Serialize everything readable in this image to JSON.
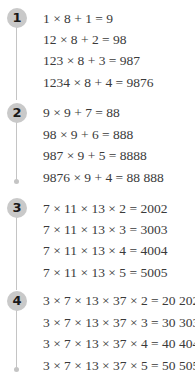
{
  "sections": [
    {
      "number": "1",
      "equations": [
        "1 × 8 + 1 = 9",
        "12 × 8 + 2 = 98",
        "123 × 8 + 3 = 987",
        "1234 × 8 + 4 = 9876"
      ]
    },
    {
      "number": "2",
      "equations": [
        "9 × 9 + 7 = 88",
        "98 × 9 + 6 = 888",
        "987 × 9 + 5 = 8888",
        "9876 × 9 + 4 = 88 888"
      ]
    },
    {
      "number": "3",
      "equations": [
        "7 × 11 × 13 × 2 = 2002",
        "7 × 11 × 13 × 3 = 3003",
        "7 × 11 × 13 × 4 = 4004",
        "7 × 11 × 13 × 5 = 5005"
      ]
    },
    {
      "number": "4",
      "equations": [
        "3 × 7 × 13 × 37 × 2 = 20 202",
        "3 × 7 × 13 × 37 × 3 = 30 303",
        "3 × 7 × 13 × 37 × 4 = 40 404",
        "3 × 7 × 13 × 37 × 5 = 50 505"
      ]
    }
  ],
  "colors": {
    "badge": "#c9c9c9",
    "line": "#c4c4c4",
    "text": "#3a3a3a"
  }
}
